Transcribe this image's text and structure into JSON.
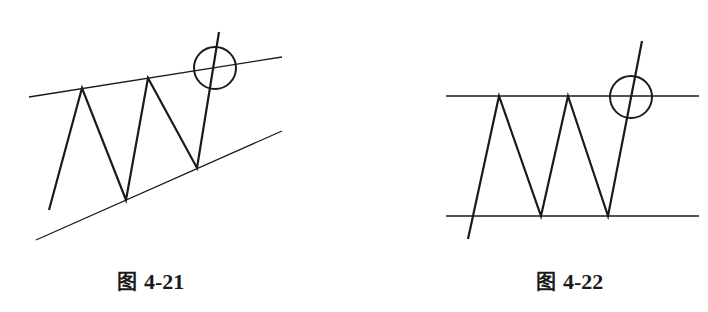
{
  "figures": [
    {
      "id": "fig-4-21",
      "caption_prefix": "图",
      "caption_number": "4-21",
      "pattern": "ascending wedge / rising channel breakout",
      "upper_line": [
        [
          29,
          97
        ],
        [
          282,
          57
        ]
      ],
      "lower_line": [
        [
          36,
          240
        ],
        [
          282,
          131
        ]
      ],
      "zigzag": [
        [
          49,
          210
        ],
        [
          82,
          88
        ],
        [
          126,
          200
        ],
        [
          148,
          78
        ],
        [
          197,
          168
        ],
        [
          219,
          32
        ]
      ],
      "breakout_circle": {
        "cx": 215,
        "cy": 68,
        "r": 21
      }
    },
    {
      "id": "fig-4-22",
      "caption_prefix": "图",
      "caption_number": "4-22",
      "pattern": "horizontal rectangle breakout",
      "upper_line": [
        [
          446,
          96
        ],
        [
          699,
          96
        ]
      ],
      "lower_line": [
        [
          446,
          216
        ],
        [
          699,
          216
        ]
      ],
      "zigzag": [
        [
          468,
          239
        ],
        [
          499,
          96
        ],
        [
          541,
          216
        ],
        [
          568,
          96
        ],
        [
          608,
          216
        ],
        [
          642,
          41
        ]
      ],
      "breakout_circle": {
        "cx": 631,
        "cy": 97,
        "r": 21
      }
    }
  ],
  "colors": {
    "stroke": "#1a1a1a",
    "background": "#ffffff"
  }
}
